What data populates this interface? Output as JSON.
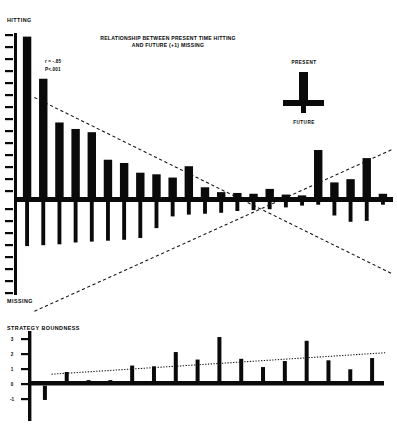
{
  "figure": {
    "title_line1": "RELATIONSHIP BETWEEN PRESENT TIME HITTING",
    "title_line2": "AND FUTURE (+1) MISSING",
    "top_axis_label": "HITTING",
    "bottom_axis_label": "MISSING",
    "lower_axis_label": "STRATEGY BOUNDNESS",
    "stat_r": "r = -.85",
    "stat_p": "P<.001",
    "key_top": "PRESENT",
    "key_bottom": "FUTURE",
    "ink_color": "#0a0a0a",
    "paper_color": "#ffffff"
  },
  "chart_data": [
    {
      "type": "bar",
      "id": "upper-panel",
      "title": "RELATIONSHIP BETWEEN PRESENT TIME HITTING AND FUTURE (+1) MISSING",
      "xlabel": "",
      "ylabel": "HITTING / MISSING",
      "ylim": [
        -10,
        10
      ],
      "grid": false,
      "legend_position": "top-right",
      "annotations": [
        "r = -.85",
        "P<.001"
      ],
      "ytick_labels": [
        "10",
        "9",
        "8",
        "7",
        "6",
        "5",
        "4",
        "3",
        "2",
        "1",
        "0",
        "1",
        "2",
        "3",
        "4",
        "5",
        "6",
        "7",
        "8",
        "9",
        "10"
      ],
      "categories": [
        "1",
        "2",
        "3",
        "4",
        "5",
        "6",
        "7",
        "8",
        "9",
        "10",
        "11",
        "12",
        "13",
        "14",
        "15",
        "16",
        "17",
        "18",
        "19",
        "20",
        "21",
        "22",
        "23"
      ],
      "series": [
        {
          "name": "PRESENT (hitting)",
          "direction": "up",
          "values": [
            9.9,
            7.3,
            4.6,
            4.2,
            4.0,
            2.3,
            2.1,
            1.5,
            1.4,
            1.2,
            1.9,
            0.6,
            0.3,
            0.25,
            0.2,
            0.5,
            0.15,
            0.1,
            2.9,
            0.9,
            1.1,
            2.4,
            0.2
          ]
        },
        {
          "name": "FUTURE (+1) missing",
          "direction": "down",
          "values": [
            4.9,
            4.8,
            4.7,
            4.5,
            4.4,
            4.3,
            4.2,
            4.0,
            2.9,
            1.6,
            1.4,
            1.3,
            1.2,
            1.0,
            0.9,
            0.8,
            0.6,
            0.4,
            0.3,
            1.5,
            2.2,
            2.1,
            0.3
          ]
        }
      ],
      "trendlines": [
        {
          "name": "hitting-regression",
          "style": "dashed",
          "x0": 0.45,
          "y0": 6.3,
          "x1": 22.6,
          "y1": -4.6
        },
        {
          "name": "missing-regression",
          "style": "dashed",
          "x0": 0.45,
          "y0": -6.9,
          "x1": 22.6,
          "y1": 3.1
        }
      ]
    },
    {
      "type": "bar",
      "id": "lower-panel",
      "title": "",
      "xlabel": "",
      "ylabel": "STRATEGY BOUNDNESS",
      "ylim": [
        -1,
        3
      ],
      "grid": false,
      "ytick_labels": [
        "3",
        "2",
        "1",
        "0",
        "-1"
      ],
      "categories": [
        "1",
        "2",
        "3",
        "4",
        "5",
        "6",
        "7",
        "8",
        "9",
        "10",
        "11",
        "12",
        "13",
        "14",
        "15",
        "16"
      ],
      "values": [
        -0.95,
        0.62,
        0.05,
        0.05,
        1.05,
        1.0,
        1.95,
        1.45,
        2.95,
        1.5,
        0.95,
        1.35,
        2.7,
        1.4,
        0.8,
        1.55
      ],
      "trendlines": [
        {
          "name": "boundness-regression",
          "style": "dotted",
          "x0": 0.3,
          "y0": 0.62,
          "x1": 15.6,
          "y1": 2.05
        }
      ]
    }
  ]
}
